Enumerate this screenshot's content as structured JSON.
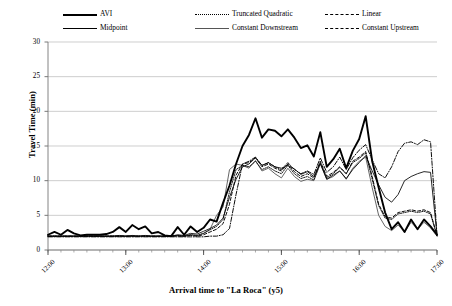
{
  "chart_data": {
    "type": "line",
    "title": "",
    "xlabel": "Arrival time to \"La Roca\" (y5)",
    "ylabel": "Travel Time (min)",
    "xlim": [
      12.0,
      17.0
    ],
    "ylim": [
      0,
      30
    ],
    "ytick_labels": [
      "0",
      "5",
      "10",
      "15",
      "20",
      "25",
      "30"
    ],
    "ytick_values": [
      0,
      5,
      10,
      15,
      20,
      25,
      30
    ],
    "xtick_labels": [
      "12:00",
      "13:00",
      "14:00",
      "15:00",
      "16:00",
      "17:00"
    ],
    "xtick_values": [
      12,
      13,
      14,
      15,
      16,
      17
    ],
    "grid": "horizontal",
    "legend_position": "top",
    "x": [
      12.0,
      12.083,
      12.167,
      12.25,
      12.333,
      12.417,
      12.5,
      12.583,
      12.667,
      12.75,
      12.833,
      12.917,
      13.0,
      13.083,
      13.167,
      13.25,
      13.333,
      13.417,
      13.5,
      13.583,
      13.667,
      13.75,
      13.833,
      13.917,
      14.0,
      14.083,
      14.167,
      14.25,
      14.333,
      14.417,
      14.5,
      14.583,
      14.667,
      14.75,
      14.833,
      14.917,
      15.0,
      15.083,
      15.167,
      15.25,
      15.333,
      15.417,
      15.5,
      15.583,
      15.667,
      15.75,
      15.833,
      15.917,
      16.0,
      16.083,
      16.167,
      16.25,
      16.333,
      16.417,
      16.5,
      16.583,
      16.667,
      16.75,
      16.833,
      16.917,
      17.0
    ],
    "series": [
      {
        "name": "AVI",
        "style": "solid-thick",
        "color": "#000000",
        "values": [
          2.2,
          2.6,
          2.2,
          2.9,
          2.4,
          2.1,
          2.2,
          2.2,
          2.2,
          2.3,
          2.6,
          3.3,
          2.6,
          3.6,
          3.0,
          3.4,
          2.4,
          2.6,
          2.1,
          2.0,
          3.3,
          2.2,
          3.4,
          2.6,
          3.2,
          4.4,
          4.1,
          6.8,
          9.3,
          12.4,
          15.0,
          16.6,
          19.0,
          16.2,
          17.4,
          17.2,
          16.4,
          17.4,
          16.2,
          14.7,
          15.1,
          13.5,
          17.0,
          12.0,
          13.1,
          14.6,
          11.8,
          14.3,
          16.0,
          19.3,
          12.8,
          9.0,
          5.4,
          3.0,
          4.0,
          2.6,
          4.4,
          3.0,
          4.4,
          3.4,
          2.2
        ],
        "peak": 19.3
      },
      {
        "name": "Midpoint",
        "style": "solid-thin",
        "color": "#000000",
        "values": [
          2.0,
          2.0,
          2.0,
          2.0,
          2.0,
          2.0,
          2.0,
          2.0,
          2.0,
          2.0,
          2.0,
          2.1,
          2.0,
          2.1,
          2.0,
          2.1,
          2.0,
          2.0,
          2.0,
          2.0,
          2.2,
          2.1,
          2.4,
          2.3,
          2.7,
          3.1,
          3.6,
          4.6,
          7.6,
          10.2,
          12.0,
          12.4,
          13.3,
          12.2,
          12.6,
          12.0,
          11.8,
          12.2,
          11.7,
          10.9,
          11.3,
          10.6,
          12.5,
          10.2,
          10.8,
          11.4,
          10.3,
          11.6,
          12.6,
          13.6,
          11.4,
          9.4,
          7.6,
          6.9,
          8.0,
          10.0,
          10.6,
          11.0,
          11.3,
          11.2,
          2.2
        ],
        "peak": 13.6
      },
      {
        "name": "Truncated Quadratic",
        "style": "dotted",
        "color": "#000000",
        "values": [
          2.0,
          2.0,
          2.0,
          2.0,
          2.0,
          2.0,
          2.0,
          2.0,
          2.0,
          2.0,
          2.0,
          2.0,
          2.0,
          2.0,
          2.0,
          2.0,
          2.0,
          2.0,
          2.0,
          2.0,
          2.1,
          2.0,
          2.2,
          2.1,
          2.4,
          2.9,
          3.4,
          4.4,
          8.4,
          11.6,
          12.2,
          12.0,
          12.8,
          11.6,
          12.0,
          11.4,
          11.0,
          12.2,
          11.0,
          10.3,
          10.6,
          10.1,
          12.6,
          10.4,
          11.0,
          11.9,
          11.0,
          12.6,
          13.2,
          14.0,
          10.2,
          6.4,
          4.6,
          4.4,
          5.2,
          5.4,
          5.6,
          5.4,
          5.6,
          5.2,
          2.0
        ],
        "peak": 14.0
      },
      {
        "name": "Constant Downstream",
        "style": "solid-gray",
        "color": "#666666",
        "values": [
          2.0,
          2.0,
          2.0,
          2.0,
          2.0,
          2.0,
          2.0,
          2.0,
          2.0,
          2.0,
          2.0,
          2.0,
          2.0,
          2.0,
          2.0,
          2.0,
          2.0,
          2.0,
          2.0,
          2.0,
          2.1,
          2.0,
          2.2,
          2.1,
          2.4,
          3.0,
          5.0,
          6.2,
          11.6,
          12.4,
          12.2,
          11.8,
          12.9,
          11.4,
          11.8,
          11.0,
          10.4,
          11.8,
          10.6,
          9.9,
          10.2,
          10.0,
          12.4,
          10.2,
          10.6,
          11.4,
          10.2,
          11.8,
          12.8,
          13.4,
          9.0,
          5.0,
          3.4,
          2.8,
          3.6,
          2.6,
          4.0,
          3.0,
          4.0,
          3.2,
          2.0
        ],
        "peak": 13.4
      },
      {
        "name": "Linear",
        "style": "dashed",
        "color": "#000000",
        "values": [
          2.0,
          2.0,
          2.0,
          2.0,
          2.0,
          2.0,
          2.0,
          2.0,
          2.0,
          2.0,
          2.0,
          2.0,
          2.0,
          2.0,
          2.0,
          2.0,
          2.0,
          2.0,
          2.0,
          2.0,
          2.0,
          2.0,
          2.1,
          2.0,
          2.2,
          2.6,
          3.0,
          3.8,
          6.6,
          10.8,
          12.4,
          12.6,
          13.3,
          12.0,
          12.4,
          11.8,
          11.4,
          12.4,
          11.3,
          10.6,
          11.0,
          10.4,
          12.8,
          10.6,
          11.2,
          12.0,
          11.0,
          12.8,
          13.4,
          14.2,
          10.6,
          6.6,
          4.8,
          4.6,
          5.4,
          5.6,
          5.8,
          5.6,
          5.8,
          5.4,
          2.1
        ],
        "peak": 14.2
      },
      {
        "name": "Constant Upstream",
        "style": "dash-dot",
        "color": "#000000",
        "values": [
          1.9,
          1.9,
          1.9,
          1.9,
          1.9,
          1.9,
          1.9,
          1.9,
          1.9,
          1.9,
          1.9,
          1.9,
          1.9,
          1.9,
          1.9,
          1.9,
          1.9,
          1.9,
          1.9,
          1.9,
          1.9,
          1.9,
          1.9,
          1.9,
          1.9,
          2.0,
          2.0,
          2.2,
          3.1,
          8.0,
          12.4,
          12.8,
          13.4,
          12.2,
          12.6,
          12.0,
          11.6,
          12.6,
          11.6,
          11.0,
          11.4,
          10.9,
          13.3,
          11.2,
          12.0,
          13.4,
          11.6,
          13.3,
          14.4,
          15.2,
          13.0,
          11.0,
          10.4,
          12.0,
          14.2,
          15.4,
          15.6,
          15.2,
          15.9,
          15.6,
          2.2
        ],
        "peak": 15.9
      }
    ]
  },
  "legend": {
    "entries": [
      {
        "label": "AVI",
        "style": "solid-thick"
      },
      {
        "label": "Midpoint",
        "style": "solid-thin"
      },
      {
        "label": "Truncated Quadratic",
        "style": "dotted"
      },
      {
        "label": "Constant Downstream",
        "style": "solid-gray"
      },
      {
        "label": "Linear",
        "style": "dashed"
      },
      {
        "label": "Constant Upstream",
        "style": "dash-dot"
      }
    ]
  }
}
